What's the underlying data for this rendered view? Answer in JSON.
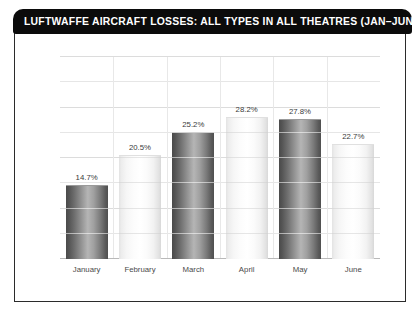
{
  "chart_data": {
    "type": "bar",
    "title": "LUFTWAFFE AIRCRAFT LOSSES: ALL TYPES IN ALL THEATRES (JAN–JUN 1944)",
    "xlabel": "",
    "ylabel": "",
    "categories": [
      "January",
      "February",
      "March",
      "April",
      "May",
      "June"
    ],
    "values": [
      14.7,
      20.5,
      25.2,
      28.2,
      27.8,
      22.7
    ],
    "value_labels": [
      "14.7%",
      "20.5%",
      "25.2%",
      "28.2%",
      "27.8%",
      "22.7%"
    ],
    "ylim": [
      0,
      40
    ],
    "yticks": [
      0,
      10,
      20,
      30,
      40
    ],
    "ytick_labels": [
      "0%",
      "10%",
      "20%",
      "30%",
      "40%"
    ],
    "grid": true,
    "legend": "none",
    "series": [
      {
        "name": "Aircraft losses",
        "values": [
          14.7,
          20.5,
          25.2,
          28.2,
          27.8,
          22.7
        ]
      }
    ],
    "bar_styles": [
      "dark",
      "light",
      "dark",
      "light",
      "dark",
      "light"
    ]
  },
  "colors": {
    "title_bar": "#0b0b0b",
    "title_text": "#ffffff",
    "frame_border": "#2b2b2b",
    "plot_background": "#ffffff",
    "gridline": "#e6e6e6",
    "baseline": "#b9b9b9",
    "bar_dark": "#6e6e6e",
    "bar_light": "#f4f4f4",
    "axis_text": "#555555",
    "label_text": "#3a3a3a"
  }
}
